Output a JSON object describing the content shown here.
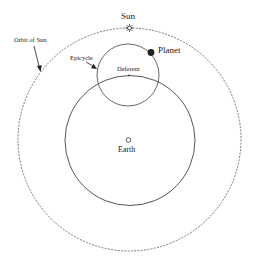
{
  "diagram": {
    "labels": {
      "sun": "Sun",
      "planet": "Planet",
      "orbit_of_sun": "Orbit of Sun",
      "epicycle": "Epicycle",
      "deferent": "Deferent",
      "earth": "Earth"
    },
    "colors": {
      "line": "#444444",
      "dashed": "#555555",
      "planet_fill": "#222222",
      "background": "#ffffff"
    }
  }
}
